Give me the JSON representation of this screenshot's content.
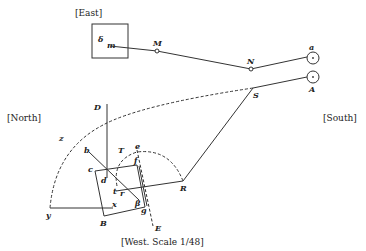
{
  "directions": {
    "east": "[East]",
    "north": "[North]",
    "south": "[South]",
    "west_scale": "[West.  Scale 1/48]"
  },
  "points": {
    "delta": "δ",
    "m": "m",
    "M": "M",
    "N": "N",
    "a": "a",
    "A": "A",
    "S": "S",
    "D": "D",
    "z": "z",
    "b": "b",
    "c": "c",
    "d": "d",
    "e": "e",
    "T": "T",
    "f": "f",
    "t": "t",
    "r": "r",
    "x": "x",
    "y": "y",
    "B": "B",
    "beta": "β",
    "g": "g",
    "R": "R",
    "E": "E"
  }
}
